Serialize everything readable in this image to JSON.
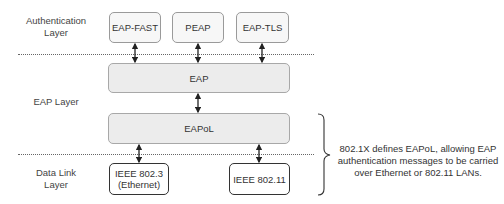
{
  "layers": [
    {
      "id": "auth",
      "label_lines": [
        "Authentication",
        "Layer"
      ]
    },
    {
      "id": "eap",
      "label_lines": [
        "EAP Layer"
      ]
    },
    {
      "id": "datalink",
      "label_lines": [
        "Data Link",
        "Layer"
      ]
    }
  ],
  "auth_methods": [
    {
      "label": "EAP-FAST"
    },
    {
      "label": "PEAP"
    },
    {
      "label": "EAP-TLS"
    }
  ],
  "eap_box": {
    "label": "EAP"
  },
  "eapol_box": {
    "label": "EAPoL"
  },
  "link_media": [
    {
      "label_lines": [
        "IEEE 802.3",
        "(Ethernet)"
      ]
    },
    {
      "label_lines": [
        "IEEE 802.11"
      ]
    }
  ],
  "annotation": {
    "lines": [
      "802.1X defines EAPoL, allowing EAP",
      "authentication messages to be carried",
      "over Ethernet or 802.11 LANs."
    ]
  },
  "colors": {
    "top_box_fill": "#f7f7f7",
    "wide_box_fill": "#ececec",
    "bottom_box_border": "#333333",
    "dotted_line": "#666666"
  }
}
